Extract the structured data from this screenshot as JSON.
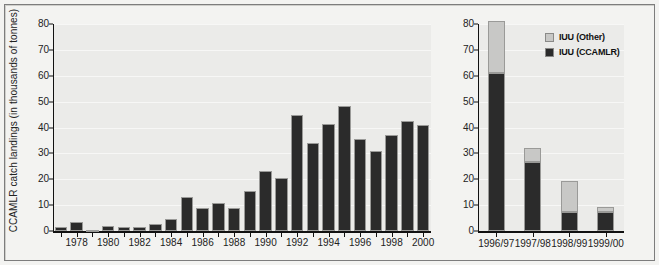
{
  "chart_data": [
    {
      "panel": "left",
      "type": "bar",
      "title": "",
      "xlabel": "",
      "ylabel": "CCAMLR catch landings (in thousands of tonnes)",
      "ylim": [
        0,
        80
      ],
      "yticks": [
        0,
        10,
        20,
        30,
        40,
        50,
        60,
        70,
        80
      ],
      "grid": true,
      "legend_position": "none",
      "categories": [
        "1977",
        "1978",
        "1979",
        "1980",
        "1981",
        "1982",
        "1983",
        "1984",
        "1985",
        "1986",
        "1987",
        "1988",
        "1989",
        "1990",
        "1991",
        "1992",
        "1993",
        "1994",
        "1995",
        "1996",
        "1997",
        "1998",
        "1999",
        "2000"
      ],
      "tick_labels": [
        "1978",
        "1980",
        "1982",
        "1984",
        "1986",
        "1988",
        "1990",
        "1992",
        "1994",
        "1996",
        "1998",
        "2000"
      ],
      "series": [
        {
          "name": "CCAMLR catch landings",
          "color": "#2b2b2b",
          "values": [
            1.5,
            3.5,
            0.5,
            2.0,
            1.7,
            1.7,
            2.8,
            4.5,
            13.3,
            9.0,
            11.0,
            9.0,
            15.3,
            23.0,
            20.5,
            45.0,
            34.0,
            41.5,
            48.5,
            35.5,
            31.0,
            37.0,
            42.5,
            41.0
          ]
        }
      ]
    },
    {
      "panel": "right",
      "type": "bar",
      "stacked": true,
      "title": "",
      "xlabel": "",
      "ylabel": "",
      "ylim": [
        0,
        80
      ],
      "yticks": [
        0,
        10,
        20,
        30,
        40,
        50,
        60,
        70,
        80
      ],
      "grid": true,
      "legend_position": "top-right",
      "categories": [
        "1996/97",
        "1997/98",
        "1998/99",
        "1999/00"
      ],
      "tick_labels": [
        "1996/97",
        "1997/98",
        "1998/99",
        "1999/00"
      ],
      "series": [
        {
          "name": "IUU (CCAMLR)",
          "color": "#2b2b2b",
          "values": [
            61.0,
            26.5,
            7.5,
            7.5
          ]
        },
        {
          "name": "IUU (Other)",
          "color": "#c8c8c6",
          "values": [
            20.0,
            5.5,
            12.0,
            1.8
          ]
        }
      ],
      "totals": [
        81.0,
        32.0,
        19.5,
        9.3
      ]
    }
  ],
  "legend": {
    "items": [
      {
        "label": "IUU (Other)",
        "color": "#c8c8c6"
      },
      {
        "label": "IUU (CCAMLR)",
        "color": "#2b2b2b"
      }
    ]
  }
}
